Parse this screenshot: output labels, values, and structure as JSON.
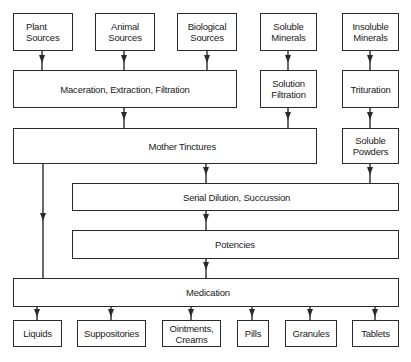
{
  "diagram": {
    "nodes": {
      "plant_sources": "Plant\nSources",
      "animal_sources": "Animal\nSources",
      "biological_sources": "Biological\nSources",
      "soluble_minerals": "Soluble\nMinerals",
      "insoluble_minerals": "Insoluble\nMinerals",
      "maceration": "Maceration,  Extraction,  Filtration",
      "solution_filtration": "Solution\nFiltration",
      "trituration": "Trituration",
      "mother_tinctures": "Mother Tinctures",
      "soluble_powders": "Soluble\nPowders",
      "serial_dilution": "Serial Dilution,  Succussion",
      "potencies": "Potencies",
      "medication": "Medication",
      "liquids": "Liquids",
      "suppositories": "Suppositories",
      "ointments": "Ointments,\nCreams",
      "pills": "Pills",
      "granules": "Granules",
      "tablets": "Tablets"
    },
    "edges": [
      [
        "Plant Sources",
        "Maceration, Extraction, Filtration"
      ],
      [
        "Animal Sources",
        "Maceration, Extraction, Filtration"
      ],
      [
        "Biological Sources",
        "Maceration, Extraction, Filtration"
      ],
      [
        "Soluble Minerals",
        "Solution Filtration"
      ],
      [
        "Insoluble Minerals",
        "Trituration"
      ],
      [
        "Maceration, Extraction, Filtration",
        "Mother Tinctures"
      ],
      [
        "Solution Filtration",
        "Mother Tinctures"
      ],
      [
        "Trituration",
        "Soluble Powders"
      ],
      [
        "Mother Tinctures",
        "Serial Dilution, Succussion"
      ],
      [
        "Mother Tinctures",
        "Medication"
      ],
      [
        "Soluble Powders",
        "Serial Dilution, Succussion"
      ],
      [
        "Serial Dilution, Succussion",
        "Potencies"
      ],
      [
        "Potencies",
        "Medication"
      ],
      [
        "Medication",
        "Liquids"
      ],
      [
        "Medication",
        "Suppositories"
      ],
      [
        "Medication",
        "Ointments, Creams"
      ],
      [
        "Medication",
        "Pills"
      ],
      [
        "Medication",
        "Granules"
      ],
      [
        "Medication",
        "Tablets"
      ]
    ],
    "colors": {
      "line": "#2a2a2a",
      "background": "#ffffff"
    }
  }
}
